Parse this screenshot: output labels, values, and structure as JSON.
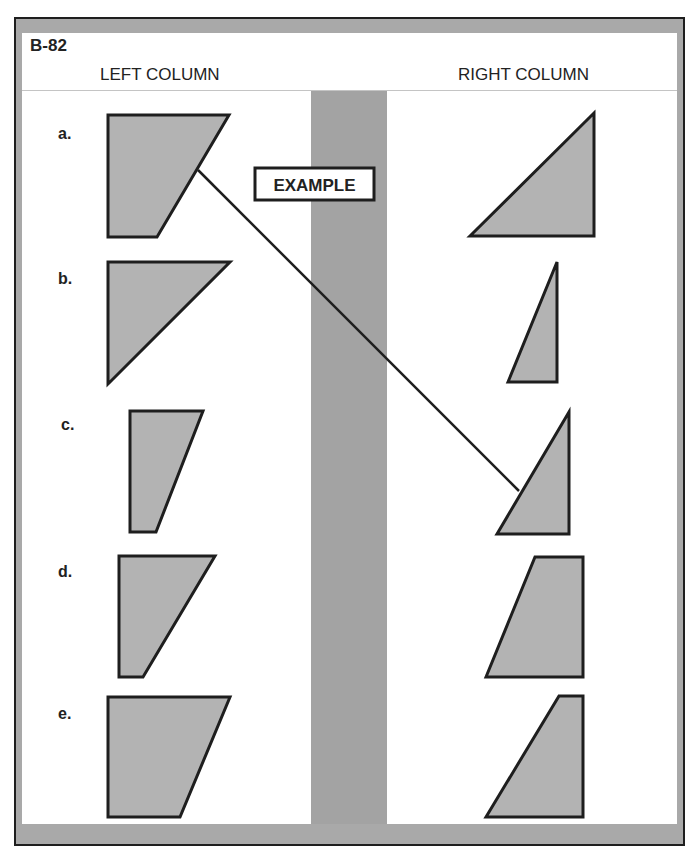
{
  "worksheet": {
    "code": "B-82",
    "left_column_title": "LEFT COLUMN",
    "right_column_title": "RIGHT COLUMN",
    "example_label": "EXAMPLE"
  },
  "colors": {
    "frame_gray": "#a9a9a9",
    "strip_gray": "#a3a3a3",
    "shape_fill": "#b3b3b3",
    "outline": "#1e1e1e",
    "panel": "#ffffff"
  },
  "left_items": [
    {
      "label": "a.",
      "shape": "trapezoid",
      "points": "108,115 229,115 157,237 108,237",
      "label_x": 58,
      "label_y": 139
    },
    {
      "label": "b.",
      "shape": "triangle",
      "points": "108,262 230,262 108,384",
      "label_x": 58,
      "label_y": 284
    },
    {
      "label": "c.",
      "shape": "trapezoid",
      "points": "130,411 203,411 156,532 130,532",
      "label_x": 61,
      "label_y": 430
    },
    {
      "label": "d.",
      "shape": "trapezoid",
      "points": "119,556 215,556 143,677 119,677",
      "label_x": 58,
      "label_y": 577
    },
    {
      "label": "e.",
      "shape": "trapezoid",
      "points": "108,697 230,697 180,817 108,817",
      "label_x": 58,
      "label_y": 719
    }
  ],
  "right_items": [
    {
      "shape": "triangle",
      "points": "470,236 594,113 594,236"
    },
    {
      "shape": "triangle",
      "points": "508,382 557,262 557,382"
    },
    {
      "shape": "triangle",
      "points": "497,534 569,412 569,534"
    },
    {
      "shape": "trapezoid",
      "points": "486,677 535,557 583,557 583,677"
    },
    {
      "shape": "trapezoid",
      "points": "486,817 559,696 583,696 583,817"
    }
  ],
  "example_match": {
    "from": "a",
    "to_right_index": 3,
    "line": {
      "x1": 198,
      "y1": 170,
      "x2": 519,
      "y2": 491
    }
  }
}
